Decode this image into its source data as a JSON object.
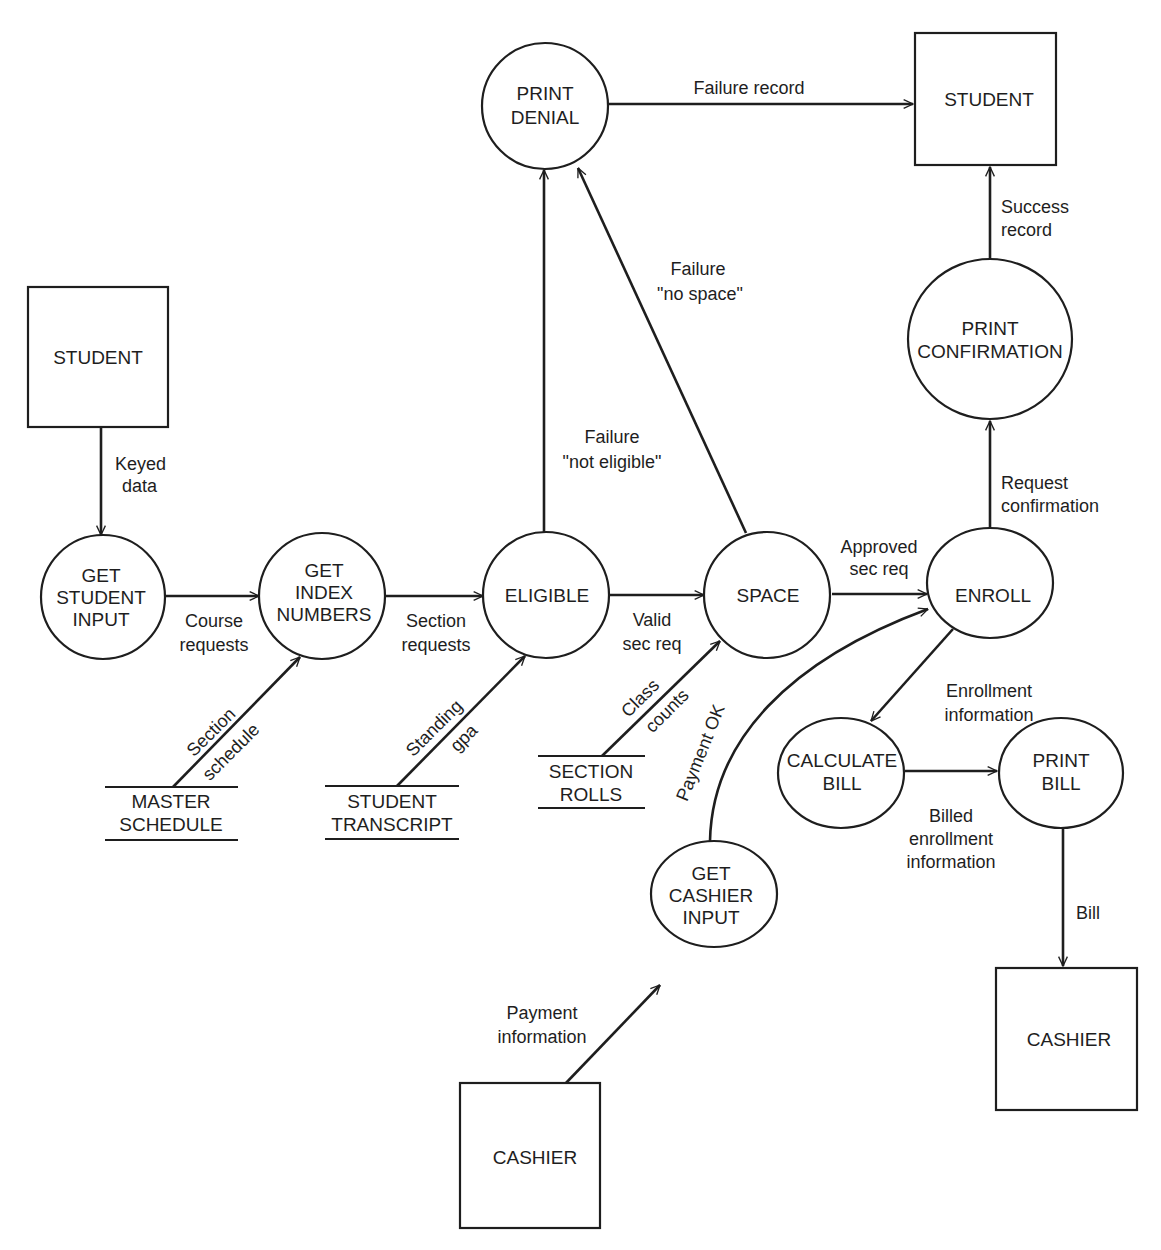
{
  "diagram": {
    "type": "data-flow-diagram",
    "external_entities": [
      {
        "id": "student_left",
        "label": "STUDENT"
      },
      {
        "id": "student_right",
        "label": "STUDENT"
      },
      {
        "id": "cashier_right",
        "label": "CASHIER"
      },
      {
        "id": "cashier_bottom",
        "label": "CASHIER"
      }
    ],
    "processes": [
      {
        "id": "get_student_input",
        "lines": [
          "GET",
          "STUDENT",
          "INPUT"
        ]
      },
      {
        "id": "get_index_numbers",
        "lines": [
          "GET",
          "INDEX",
          "NUMBERS"
        ]
      },
      {
        "id": "eligible",
        "lines": [
          "ELIGIBLE"
        ]
      },
      {
        "id": "space",
        "lines": [
          "SPACE"
        ]
      },
      {
        "id": "enroll",
        "lines": [
          "ENROLL"
        ]
      },
      {
        "id": "print_denial",
        "lines": [
          "PRINT",
          "DENIAL"
        ]
      },
      {
        "id": "print_confirmation",
        "lines": [
          "PRINT",
          "CONFIRMATION"
        ]
      },
      {
        "id": "calculate_bill",
        "lines": [
          "CALCULATE",
          "BILL"
        ]
      },
      {
        "id": "print_bill",
        "lines": [
          "PRINT",
          "BILL"
        ]
      },
      {
        "id": "get_cashier_input",
        "lines": [
          "GET",
          "CASHIER",
          "INPUT"
        ]
      }
    ],
    "data_stores": [
      {
        "id": "master_schedule",
        "lines": [
          "MASTER",
          "SCHEDULE"
        ]
      },
      {
        "id": "student_transcript",
        "lines": [
          "STUDENT",
          "TRANSCRIPT"
        ]
      },
      {
        "id": "section_rolls",
        "lines": [
          "SECTION",
          "ROLLS"
        ]
      }
    ],
    "flows": [
      {
        "id": "keyed_data",
        "from": "student_left",
        "to": "get_student_input",
        "lines": [
          "Keyed",
          "data"
        ]
      },
      {
        "id": "course_requests",
        "from": "get_student_input",
        "to": "get_index_numbers",
        "lines": [
          "Course",
          "requests"
        ]
      },
      {
        "id": "section_requests",
        "from": "get_index_numbers",
        "to": "eligible",
        "lines": [
          "Section",
          "requests"
        ]
      },
      {
        "id": "valid_sec_req",
        "from": "eligible",
        "to": "space",
        "lines": [
          "Valid",
          "sec req"
        ]
      },
      {
        "id": "approved_sec_req",
        "from": "space",
        "to": "enroll",
        "lines": [
          "Approved",
          "sec req"
        ]
      },
      {
        "id": "section_schedule",
        "from": "master_schedule",
        "to": "get_index_numbers",
        "lines": [
          "Section",
          "schedule"
        ]
      },
      {
        "id": "standing_gpa",
        "from": "student_transcript",
        "to": "eligible",
        "lines": [
          "Standing",
          "gpa"
        ]
      },
      {
        "id": "class_counts",
        "from": "section_rolls",
        "to": "space",
        "lines": [
          "Class",
          "counts"
        ]
      },
      {
        "id": "failure_not_eligible",
        "from": "eligible",
        "to": "print_denial",
        "lines": [
          "Failure",
          "\"not eligible\""
        ]
      },
      {
        "id": "failure_no_space",
        "from": "space",
        "to": "print_denial",
        "lines": [
          "Failure",
          "\"no space\""
        ]
      },
      {
        "id": "failure_record",
        "from": "print_denial",
        "to": "student_right",
        "lines": [
          "Failure record"
        ]
      },
      {
        "id": "request_confirmation",
        "from": "enroll",
        "to": "print_confirmation",
        "lines": [
          "Request",
          "confirmation"
        ]
      },
      {
        "id": "success_record",
        "from": "print_confirmation",
        "to": "student_right",
        "lines": [
          "Success",
          "record"
        ]
      },
      {
        "id": "enrollment_information",
        "from": "enroll",
        "to": "calculate_bill",
        "lines": [
          "Enrollment",
          "information"
        ]
      },
      {
        "id": "billed_enrollment_information",
        "from": "calculate_bill",
        "to": "print_bill",
        "lines": [
          "Billed",
          "enrollment",
          "information"
        ]
      },
      {
        "id": "bill",
        "from": "print_bill",
        "to": "cashier_right",
        "lines": [
          "Bill"
        ]
      },
      {
        "id": "payment_ok",
        "from": "get_cashier_input",
        "to": "enroll",
        "lines": [
          "Payment OK"
        ]
      },
      {
        "id": "payment_information",
        "from": "cashier_bottom",
        "to": "get_cashier_input",
        "lines": [
          "Payment",
          "information"
        ]
      }
    ]
  },
  "colors": {
    "ink": "#1e1e1e",
    "paper": "#ffffff"
  }
}
